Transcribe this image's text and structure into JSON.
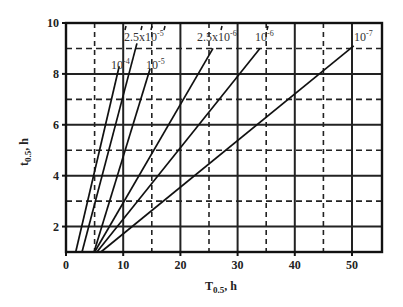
{
  "chart_data": {
    "type": "line",
    "title": "",
    "xlabel": "T0.5, h",
    "ylabel": "t0.5, h",
    "xlim": [
      0,
      55
    ],
    "ylim": [
      1,
      10
    ],
    "x_ticks": [
      0,
      10,
      20,
      30,
      40,
      50
    ],
    "y_ticks": [
      2,
      4,
      6,
      8,
      10
    ],
    "grid": {
      "major_solid": true,
      "minor_dashed": true,
      "x_dashed_at": [
        5,
        15,
        25,
        35,
        45
      ],
      "y_dashed_at": [
        3,
        5,
        7,
        9
      ]
    },
    "series": [
      {
        "name": "10^-4",
        "label_base": "10",
        "label_exp": "-4",
        "x": [
          1.7,
          9.3
        ],
        "y": [
          1,
          8.3
        ]
      },
      {
        "name": "2.5x10^-5",
        "label_base": "2.5x10",
        "label_exp": "-5",
        "x": [
          2.8,
          12.4
        ],
        "y": [
          1,
          9.2
        ]
      },
      {
        "name": "10^-5",
        "label_base": "10",
        "label_exp": "-5",
        "x": [
          4.9,
          14.7
        ],
        "y": [
          1,
          8.2
        ]
      },
      {
        "name": "2.5x10^-6",
        "label_base": "2.5x10",
        "label_exp": "-6",
        "x": [
          5.0,
          25.7
        ],
        "y": [
          1,
          9.0
        ]
      },
      {
        "name": "10^-6",
        "label_base": "10",
        "label_exp": "-6",
        "x": [
          5.4,
          33.9
        ],
        "y": [
          1,
          9.0
        ]
      },
      {
        "name": "10^-7",
        "label_base": "10",
        "label_exp": "-7",
        "x": [
          6.1,
          50.3
        ],
        "y": [
          1,
          9.1
        ]
      }
    ]
  },
  "axis_labels": {
    "x_main": "T",
    "x_sub": "0.5",
    "x_unit": ", h",
    "y_main": "t",
    "y_sub": "0.5",
    "y_unit": ", h"
  }
}
